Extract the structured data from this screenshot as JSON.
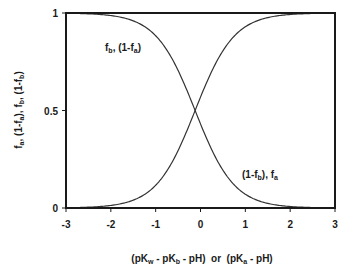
{
  "chart_data": {
    "type": "line",
    "title": "",
    "xlabel": "(pK_w - pK_b - pH) or (pK_a - pH)",
    "ylabel": "f_a, (1-f_a), f_b, (1-f_b)",
    "xlim": [
      -3,
      3
    ],
    "ylim": [
      0,
      1
    ],
    "xticks": [
      -3,
      -2,
      -1,
      0,
      1,
      2,
      3
    ],
    "yticks": [
      0,
      0.5,
      1
    ],
    "ytick_labels": [
      "0",
      "0.5",
      "1"
    ],
    "grid": false,
    "legend": "none (inline curve labels)",
    "crossing_point": {
      "x": -0.12,
      "y": 0.5
    },
    "series": [
      {
        "name": "f_b, (1-f_a)",
        "shape": "decreasing sigmoid",
        "x": [
          -3,
          -2.5,
          -2,
          -1.5,
          -1,
          -0.5,
          -0.12,
          0.5,
          1,
          1.5,
          2,
          2.5,
          3
        ],
        "values": [
          1.0,
          0.99,
          0.98,
          0.95,
          0.88,
          0.7,
          0.5,
          0.19,
          0.07,
          0.025,
          0.01,
          0.003,
          0.0
        ]
      },
      {
        "name": "(1-f_b), f_a",
        "shape": "increasing sigmoid",
        "x": [
          -3,
          -2.5,
          -2,
          -1.5,
          -1,
          -0.5,
          -0.12,
          0.5,
          1,
          1.5,
          2,
          2.5,
          3
        ],
        "values": [
          0.0,
          0.01,
          0.02,
          0.05,
          0.12,
          0.3,
          0.5,
          0.81,
          0.93,
          0.975,
          0.99,
          0.997,
          1.0
        ]
      }
    ]
  },
  "labels": {
    "y_axis_title": "f_a, (1-f_a), f_b, (1-f_b)",
    "x_axis_title_part1": "(pK",
    "x_axis_title_sub_w": "w",
    "x_axis_title_part2": " - pK",
    "x_axis_title_sub_b": "b",
    "x_axis_title_part3": " - pH)  or  (pK",
    "x_axis_title_sub_a": "a",
    "x_axis_title_part4": " - pH)",
    "curve1_label": "f_b, (1-f_a)",
    "curve2_label": "(1-f_b), f_a"
  },
  "colors": {
    "axis": "#1a1a1a",
    "curve": "#333333",
    "background": "#ffffff"
  }
}
